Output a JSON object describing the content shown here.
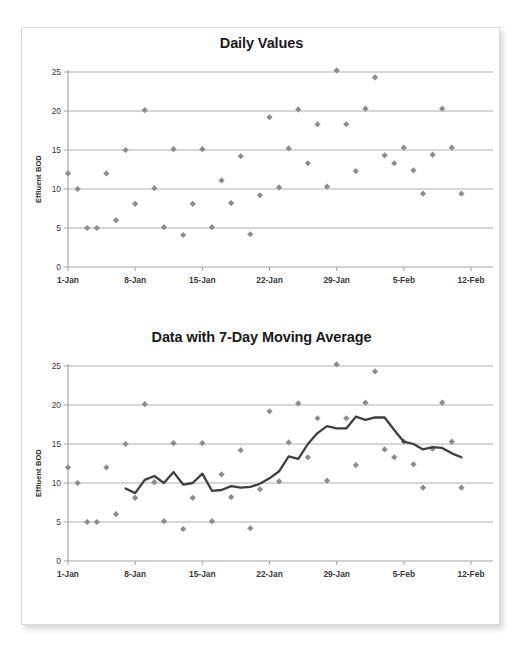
{
  "page": {
    "background_color": "#ffffff",
    "sheet_border_color": "#d8d8d8"
  },
  "style": {
    "marker_color": "#8c8c8c",
    "gridline_color": "#a6a6a6",
    "axis_color": "#9a9a9a",
    "line_color": "#3f3f3f",
    "title_color": "#1a1a1a",
    "tick_label_color": "#3a3a3a"
  },
  "charts": [
    {
      "id": "daily-values",
      "title": "Daily Values",
      "ylabel": "Effluent BOD"
    },
    {
      "id": "moving-average",
      "title": "Data with 7-Day Moving Average",
      "ylabel": "Effluent BOD"
    }
  ],
  "chart_data": [
    {
      "type": "scatter",
      "title": "Daily Values",
      "xlabel": "",
      "ylabel": "Effluent BOD",
      "ylim": [
        0,
        25
      ],
      "yticks": [
        0,
        5,
        10,
        15,
        20,
        25
      ],
      "xticks": [
        "1-Jan",
        "8-Jan",
        "15-Jan",
        "22-Jan",
        "29-Jan",
        "5-Feb",
        "12-Feb"
      ],
      "xtick_days": [
        1,
        8,
        15,
        22,
        29,
        36,
        43
      ],
      "xlim_days": [
        1,
        43
      ],
      "grid": true,
      "legend": "none",
      "series": [
        {
          "name": "Effluent BOD",
          "marker": "diamond",
          "color": "#8c8c8c",
          "x": [
            1,
            2,
            3,
            4,
            5,
            6,
            7,
            8,
            9,
            10,
            11,
            12,
            13,
            14,
            15,
            16,
            17,
            18,
            19,
            20,
            21,
            22,
            23,
            24,
            25,
            26,
            27,
            28,
            29,
            30,
            31,
            32,
            33,
            34,
            35,
            36,
            37,
            38,
            39,
            40,
            41,
            42
          ],
          "values": [
            12.0,
            10.0,
            5.0,
            5.0,
            12.0,
            6.0,
            15.0,
            8.1,
            20.1,
            10.1,
            5.1,
            15.1,
            4.1,
            8.1,
            15.1,
            5.1,
            11.1,
            8.2,
            14.2,
            4.2,
            9.2,
            19.2,
            10.2,
            15.2,
            20.2,
            13.3,
            18.3,
            10.3,
            25.2,
            18.3,
            12.3,
            20.3,
            24.3,
            14.3,
            13.3,
            15.3,
            12.4,
            9.4,
            14.4,
            20.3,
            15.3,
            9.4
          ]
        }
      ]
    },
    {
      "type": "scatter+line",
      "title": "Data with 7-Day Moving Average",
      "xlabel": "",
      "ylabel": "Effluent BOD",
      "ylim": [
        0,
        25
      ],
      "yticks": [
        0,
        5,
        10,
        15,
        20,
        25
      ],
      "xticks": [
        "1-Jan",
        "8-Jan",
        "15-Jan",
        "22-Jan",
        "29-Jan",
        "5-Feb",
        "12-Feb"
      ],
      "xtick_days": [
        1,
        8,
        15,
        22,
        29,
        36,
        43
      ],
      "xlim_days": [
        1,
        43
      ],
      "grid": true,
      "legend": "none",
      "series": [
        {
          "name": "Effluent BOD",
          "marker": "diamond",
          "color": "#8c8c8c",
          "x": [
            1,
            2,
            3,
            4,
            5,
            6,
            7,
            8,
            9,
            10,
            11,
            12,
            13,
            14,
            15,
            16,
            17,
            18,
            19,
            20,
            21,
            22,
            23,
            24,
            25,
            26,
            27,
            28,
            29,
            30,
            31,
            32,
            33,
            34,
            35,
            36,
            37,
            38,
            39,
            40,
            41,
            42
          ],
          "values": [
            12.0,
            10.0,
            5.0,
            5.0,
            12.0,
            6.0,
            15.0,
            8.1,
            20.1,
            10.1,
            5.1,
            15.1,
            4.1,
            8.1,
            15.1,
            5.1,
            11.1,
            8.2,
            14.2,
            4.2,
            9.2,
            19.2,
            10.2,
            15.2,
            20.2,
            13.3,
            18.3,
            10.3,
            25.2,
            18.3,
            12.3,
            20.3,
            24.3,
            14.3,
            13.3,
            15.3,
            12.4,
            9.4,
            14.4,
            20.3,
            15.3,
            9.4
          ]
        },
        {
          "name": "7-Day Moving Average",
          "marker": "none",
          "color": "#3f3f3f",
          "x": [
            7,
            8,
            9,
            10,
            11,
            12,
            13,
            14,
            15,
            16,
            17,
            18,
            19,
            20,
            21,
            22,
            23,
            24,
            25,
            26,
            27,
            28,
            29,
            30,
            31,
            32,
            33,
            34,
            35,
            36,
            37,
            38,
            39,
            40,
            41,
            42
          ],
          "values": [
            9.3,
            8.7,
            10.4,
            10.9,
            10.0,
            11.4,
            9.8,
            10.0,
            11.2,
            9.0,
            9.1,
            9.6,
            9.4,
            9.5,
            9.9,
            10.6,
            11.5,
            13.4,
            13.1,
            15.0,
            16.4,
            17.3,
            17.0,
            17.0,
            18.5,
            18.1,
            18.4,
            18.4,
            16.8,
            15.3,
            15.0,
            14.3,
            14.6,
            14.5,
            13.8,
            13.3
          ]
        }
      ]
    }
  ]
}
